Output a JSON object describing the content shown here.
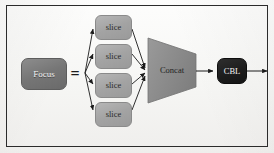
{
  "figure": {
    "background_color": "#fbfbfa",
    "border_color": "#2b2b2b"
  },
  "nodes": {
    "focus": {
      "label": "Focus",
      "shape": "rounded-rect",
      "fill": "#7a7a7a",
      "text_color": "#f2f2f2"
    },
    "equals": {
      "label": "=",
      "shape": "glyph",
      "text_color": "#1c1c1c"
    },
    "slices": [
      {
        "label": "slice",
        "shape": "rounded-rect",
        "fill": "#a7a7a7",
        "text_color": "#2a2a2a"
      },
      {
        "label": "slice",
        "shape": "rounded-rect",
        "fill": "#a7a7a7",
        "text_color": "#2a2a2a"
      },
      {
        "label": "slice",
        "shape": "rounded-rect",
        "fill": "#a7a7a7",
        "text_color": "#2a2a2a"
      },
      {
        "label": "slice",
        "shape": "rounded-rect",
        "fill": "#a7a7a7",
        "text_color": "#2a2a2a"
      }
    ],
    "concat": {
      "label": "Concat",
      "shape": "trapezoid",
      "fill": "#8f8f8f",
      "text_color": "#222222"
    },
    "cbl": {
      "label": "CBL",
      "shape": "rounded-rect",
      "fill": "#1d1d1d",
      "text_color": "#f4f4f4"
    }
  },
  "edges": [
    {
      "from": "equals",
      "to": "slice-0",
      "style": "solid-arrow"
    },
    {
      "from": "equals",
      "to": "slice-1",
      "style": "solid-arrow"
    },
    {
      "from": "equals",
      "to": "slice-2",
      "style": "solid-arrow"
    },
    {
      "from": "equals",
      "to": "slice-3",
      "style": "solid-arrow"
    },
    {
      "from": "slice-0",
      "to": "concat",
      "style": "solid-arrow"
    },
    {
      "from": "slice-1",
      "to": "concat",
      "style": "solid-arrow"
    },
    {
      "from": "slice-2",
      "to": "concat",
      "style": "solid-arrow"
    },
    {
      "from": "slice-3",
      "to": "concat",
      "style": "solid-arrow"
    },
    {
      "from": "concat",
      "to": "cbl",
      "style": "solid-arrow"
    },
    {
      "from": "cbl",
      "to": "output",
      "style": "solid-arrow"
    }
  ]
}
